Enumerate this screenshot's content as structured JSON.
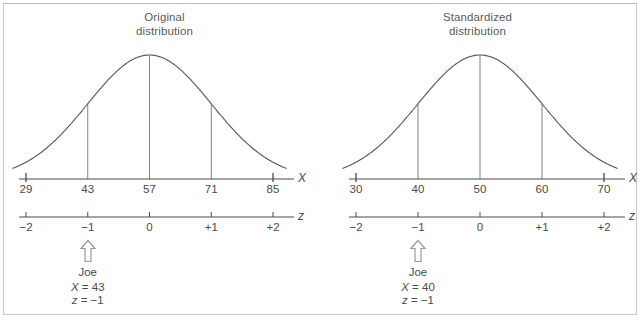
{
  "figure": {
    "background": "#ffffff",
    "border_color": "#c9c9c9",
    "ink_color": "#4a4a4a",
    "curve_color": "#555555"
  },
  "chart_data": {
    "type": "line",
    "panels": [
      {
        "id": "original",
        "title_line1": "Original",
        "title_line2": "distribution",
        "curve": "normal",
        "mean": 57,
        "sd": 14,
        "x_axis": {
          "label": "X",
          "ticks": [
            29,
            43,
            57,
            71,
            85
          ],
          "tick_labels": [
            "29",
            "43",
            "57",
            "71",
            "85"
          ],
          "range": [
            29,
            85
          ]
        },
        "z_axis": {
          "label": "z",
          "ticks": [
            -2,
            -1,
            0,
            1,
            2
          ],
          "tick_labels": [
            "−2",
            "−1",
            "0",
            "+1",
            "+2"
          ],
          "range": [
            -2,
            2
          ]
        },
        "markers": [
          {
            "z": -1,
            "height_fraction": 0.6065
          },
          {
            "z": 0,
            "height_fraction": 1.0
          },
          {
            "z": 1,
            "height_fraction": 0.6065
          }
        ],
        "callout": {
          "at_z": -1,
          "person": "Joe",
          "x_symbol": "X",
          "x_equals": "= 43",
          "z_symbol": "z",
          "z_equals": "= −1",
          "arrow": "up-arrow-outline"
        }
      },
      {
        "id": "standardized",
        "title_line1": "Standardized",
        "title_line2": "distribution",
        "curve": "normal",
        "mean": 50,
        "sd": 10,
        "x_axis": {
          "label": "X",
          "ticks": [
            30,
            40,
            50,
            60,
            70
          ],
          "tick_labels": [
            "30",
            "40",
            "50",
            "60",
            "70"
          ],
          "range": [
            30,
            70
          ]
        },
        "z_axis": {
          "label": "z",
          "ticks": [
            -2,
            -1,
            0,
            1,
            2
          ],
          "tick_labels": [
            "−2",
            "−1",
            "0",
            "+1",
            "+2"
          ],
          "range": [
            -2,
            2
          ]
        },
        "markers": [
          {
            "z": -1,
            "height_fraction": 0.6065
          },
          {
            "z": 0,
            "height_fraction": 1.0
          },
          {
            "z": 1,
            "height_fraction": 0.6065
          }
        ],
        "callout": {
          "at_z": -1,
          "person": "Joe",
          "x_symbol": "X",
          "x_equals": "= 40",
          "z_symbol": "z",
          "z_equals": "= −1",
          "arrow": "up-arrow-outline"
        }
      }
    ],
    "xlabel": "X",
    "ylabel": "",
    "grid": false,
    "legend": "none"
  }
}
